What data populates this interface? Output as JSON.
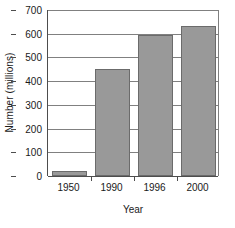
{
  "chart_data": {
    "type": "bar",
    "title": "",
    "xlabel": "Year",
    "ylabel": "Number (millions)",
    "categories": [
      "1950",
      "1990",
      "1996",
      "2000"
    ],
    "values": [
      20,
      450,
      595,
      633
    ],
    "ylim": [
      0,
      700
    ],
    "yticks": [
      0,
      100,
      200,
      300,
      400,
      500,
      600,
      700
    ],
    "ytick_labels": [
      "0",
      "100",
      "200",
      "300",
      "400",
      "500",
      "600",
      "700"
    ],
    "grid": true,
    "legend": "none",
    "colors": {
      "bar_fill": "#999999",
      "bar_edge": "#6b6b6b",
      "grid": "#808080",
      "axis": "#4d4d4d",
      "background": "#ffffff",
      "text": "#1a1a1a"
    }
  }
}
